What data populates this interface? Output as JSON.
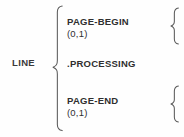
{
  "diagram": {
    "type": "brace-structure-diagram",
    "root": {
      "label": "LINE"
    },
    "rows": [
      {
        "name": "page-begin",
        "title": "PAGE-BEGIN",
        "subtitle": "(0,1)",
        "has_right_brace": true
      },
      {
        "name": "processing",
        "title": ".PROCESSING",
        "subtitle": "",
        "has_right_brace": false
      },
      {
        "name": "page-end",
        "title": "PAGE-END",
        "subtitle": "(0,1)",
        "has_right_brace": true
      }
    ],
    "braces": {
      "main": "left-curly-brace",
      "right_top": "left-curly-brace",
      "right_bottom": "left-curly-brace"
    },
    "colors": {
      "background": "#fefefe",
      "text": "#2f2f2f",
      "stroke": "#5b5b5b"
    }
  }
}
